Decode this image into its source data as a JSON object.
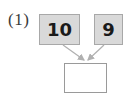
{
  "problem": {
    "label": "(1)",
    "left_number": "10",
    "right_number": "9",
    "answer_value": ""
  },
  "colors": {
    "box_fill": "#d9d9d9",
    "box_border": "#a8a8a8",
    "arrow": "#b0b0b0",
    "answer_border": "#9a9a9a"
  },
  "icons": [
    "arrow-down-right-icon",
    "arrow-down-left-icon"
  ]
}
